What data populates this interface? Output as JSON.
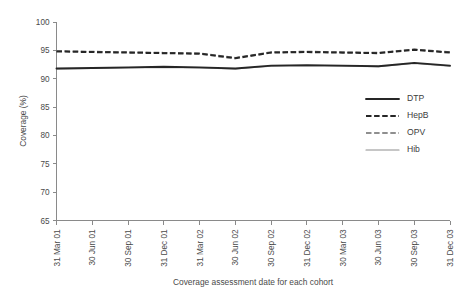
{
  "chart_data": {
    "type": "line",
    "title": "",
    "xlabel": "Coverage assessment date for each cohort",
    "ylabel": "Coverage (%)",
    "ylim": [
      65,
      100
    ],
    "yticks": [
      65,
      70,
      75,
      80,
      85,
      90,
      95,
      100
    ],
    "grid": false,
    "legend_position": "right-middle",
    "categories": [
      "31 Mar 01",
      "30 Jun 01",
      "30 Sep 01",
      "31 Dec 01",
      "31 Mar 02",
      "30 Jun 02",
      "30 Sep 02",
      "31 Dec 02",
      "30 Mar 03",
      "30 Jun 03",
      "30 Sep 03",
      "31 Dec 03"
    ],
    "series": [
      {
        "name": "DTP",
        "style": "solid-thick-black",
        "color": "#262626",
        "values": [
          91.8,
          91.9,
          92.0,
          92.1,
          92.0,
          91.8,
          92.3,
          92.4,
          92.3,
          92.2,
          92.8,
          92.3
        ]
      },
      {
        "name": "HepB",
        "style": "dashed-thick-black",
        "color": "#262626",
        "values": [
          94.8,
          94.7,
          94.6,
          94.5,
          94.4,
          93.6,
          94.6,
          94.7,
          94.6,
          94.5,
          95.1,
          94.6
        ]
      },
      {
        "name": "OPV",
        "style": "dashed-grey",
        "color": "#6b6b6b",
        "values": [
          94.9,
          94.8,
          94.7,
          94.6,
          94.5,
          93.7,
          94.7,
          94.8,
          94.7,
          94.6,
          95.2,
          94.7
        ]
      },
      {
        "name": "Hib",
        "style": "solid-thin-grey",
        "color": "#8d8d8d",
        "values": [
          91.7,
          91.8,
          91.9,
          92.0,
          91.9,
          91.7,
          92.2,
          92.3,
          92.2,
          92.1,
          92.7,
          92.2
        ]
      }
    ]
  },
  "legend": {
    "items": [
      {
        "label": "DTP"
      },
      {
        "label": "HepB"
      },
      {
        "label": "OPV"
      },
      {
        "label": "Hib"
      }
    ]
  },
  "axes": {
    "y_title": "Coverage (%)",
    "x_title": "Coverage assessment date for each cohort",
    "y_tick_labels": [
      "100",
      "95",
      "90",
      "85",
      "80",
      "75",
      "70",
      "65"
    ],
    "x_tick_labels": [
      "31 Mar 01",
      "30 Jun 01",
      "30 Sep 01",
      "31 Dec 01",
      "31 Mar 02",
      "30 Jun 02",
      "30 Sep 02",
      "31 Dec 02",
      "30 Mar 03",
      "30 Jun 03",
      "30 Sep 03",
      "31 Dec 03"
    ]
  },
  "colors": {
    "axis": "#8a8a8a",
    "text": "#4a4a4a",
    "dtp": "#262626",
    "hepb": "#262626",
    "opv": "#6b6b6b",
    "hib": "#8d8d8d"
  }
}
